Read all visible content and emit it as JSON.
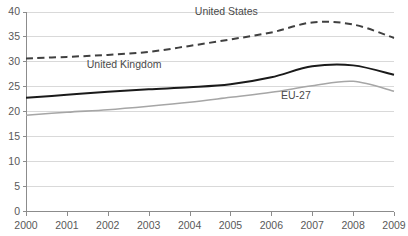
{
  "chart_data": {
    "type": "line",
    "title": "",
    "subtitle": "",
    "xlabel": "",
    "ylabel": "",
    "x": [
      2000,
      2001,
      2002,
      2003,
      2004,
      2005,
      2006,
      2007,
      2008,
      2009
    ],
    "xticklabels": [
      "2000",
      "2001",
      "2002",
      "2003",
      "2004",
      "2005",
      "2006",
      "2007",
      "2008",
      "2009"
    ],
    "yticklabels": [
      "0",
      "5",
      "10",
      "15",
      "20",
      "25",
      "30",
      "35",
      "40"
    ],
    "yticks": [
      0,
      5,
      10,
      15,
      20,
      25,
      30,
      35,
      40
    ],
    "ylim": [
      0,
      40
    ],
    "xlim": [
      2000,
      2009
    ],
    "grid": "horizontal",
    "legend_position": "inline-annotations",
    "series": [
      {
        "name": "United States",
        "style": "dashed",
        "color": "#404040",
        "width": 2.0,
        "label_x": 2004.9,
        "label_y": 39.2,
        "values": [
          30.6,
          30.9,
          31.3,
          31.9,
          33.1,
          34.4,
          35.8,
          37.8,
          37.4,
          34.7
        ]
      },
      {
        "name": "United Kingdom",
        "style": "solid",
        "color": "#1a1a1a",
        "width": 2.0,
        "label_x": 2002.4,
        "label_y": 28.6,
        "values": [
          22.7,
          23.3,
          23.9,
          24.4,
          24.8,
          25.4,
          26.8,
          29.0,
          29.2,
          27.3
        ]
      },
      {
        "name": "EU-27",
        "style": "solid",
        "color": "#a6a6a6",
        "width": 1.6,
        "label_x": 2006.6,
        "label_y": 22.5,
        "values": [
          19.2,
          19.8,
          20.3,
          21.0,
          21.8,
          22.8,
          23.8,
          25.1,
          26.0,
          24.0
        ]
      }
    ]
  },
  "colors": {
    "background": "#ffffff",
    "gridline": "#d9d9d9",
    "axis": "#8c8c8c",
    "tick_label": "#595959",
    "series_us": "#404040",
    "series_uk": "#1a1a1a",
    "series_eu": "#a6a6a6"
  },
  "geometry": {
    "plot_left": 26,
    "plot_right": 394,
    "plot_top": 11.5,
    "plot_bottom": 211
  }
}
